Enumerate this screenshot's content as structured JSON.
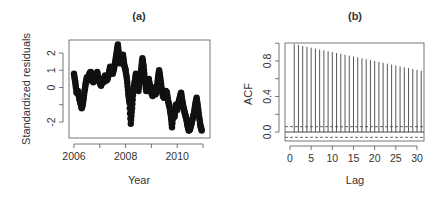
{
  "chart_data": [
    {
      "type": "line",
      "title": "(a)",
      "xlabel": "Year",
      "ylabel": "Standardized residuals",
      "xlim": [
        2006,
        2011
      ],
      "ylim": [
        -2.9,
        2.7
      ],
      "x_ticks": [
        2006,
        2007,
        2008,
        2009,
        2010,
        2011
      ],
      "x_tick_labels": [
        "2006",
        "2008",
        "2010"
      ],
      "x_tick_labels_at": [
        2006,
        2008,
        2010
      ],
      "y_ticks": [
        -2,
        -1,
        0,
        1,
        2
      ],
      "y_tick_labels": [
        "-2",
        "0",
        "1",
        "2"
      ],
      "y_tick_labels_at": [
        -2,
        0,
        1,
        2
      ],
      "grid": false,
      "marker": "filled-circle",
      "series": [
        {
          "name": "residuals",
          "x": [
            2006.0,
            2006.05,
            2006.1,
            2006.15,
            2006.2,
            2006.25,
            2006.3,
            2006.35,
            2006.4,
            2006.45,
            2006.5,
            2006.55,
            2006.6,
            2006.65,
            2006.7,
            2006.75,
            2006.8,
            2006.85,
            2006.9,
            2006.95,
            2007.0,
            2007.05,
            2007.1,
            2007.15,
            2007.2,
            2007.25,
            2007.3,
            2007.35,
            2007.4,
            2007.45,
            2007.5,
            2007.55,
            2007.6,
            2007.65,
            2007.7,
            2007.75,
            2007.8,
            2007.85,
            2007.9,
            2007.95,
            2008.0,
            2008.05,
            2008.1,
            2008.15,
            2008.2,
            2008.25,
            2008.3,
            2008.35,
            2008.4,
            2008.45,
            2008.5,
            2008.55,
            2008.6,
            2008.65,
            2008.7,
            2008.75,
            2008.8,
            2008.85,
            2008.9,
            2008.95,
            2009.0,
            2009.05,
            2009.1,
            2009.15,
            2009.2,
            2009.25,
            2009.3,
            2009.35,
            2009.4,
            2009.45,
            2009.5,
            2009.55,
            2009.6,
            2009.65,
            2009.7,
            2009.75,
            2009.8,
            2009.85,
            2009.9,
            2009.95,
            2010.0,
            2010.05,
            2010.1,
            2010.15,
            2010.2,
            2010.25,
            2010.3,
            2010.35,
            2010.4,
            2010.45,
            2010.5,
            2010.55,
            2010.6,
            2010.65,
            2010.7,
            2010.75,
            2010.8,
            2010.85,
            2010.9,
            2010.95
          ],
          "values": [
            0.8,
            0.3,
            -0.3,
            -0.2,
            -0.6,
            -0.9,
            -1.2,
            -0.9,
            -0.3,
            0.2,
            0.6,
            0.4,
            0.8,
            0.9,
            0.5,
            0.3,
            0.7,
            0.4,
            0.9,
            0.5,
            0.3,
            0.1,
            0.5,
            0.3,
            0.7,
            0.4,
            0.5,
            0.8,
            1.2,
            0.9,
            0.8,
            1.1,
            1.5,
            2.0,
            2.5,
            1.8,
            1.4,
            1.8,
            1.9,
            1.3,
            1.0,
            0.5,
            -0.3,
            -0.9,
            -2.1,
            -1.2,
            -0.2,
            0.3,
            0.8,
            0.3,
            -0.2,
            0.6,
            1.0,
            1.7,
            1.2,
            0.4,
            -0.2,
            0.4,
            0.5,
            0.0,
            -0.3,
            -0.5,
            0.0,
            -0.4,
            -0.2,
            0.5,
            1.0,
            0.5,
            -0.1,
            -0.5,
            -0.6,
            -0.2,
            -0.3,
            -0.8,
            -1.1,
            -1.6,
            -2.3,
            -1.4,
            -1.7,
            -1.0,
            -1.3,
            -0.9,
            -0.6,
            -0.3,
            -0.8,
            -1.2,
            -1.5,
            -1.8,
            -2.2,
            -2.5,
            -2.4,
            -2.1,
            -1.8,
            -1.5,
            -1.0,
            -0.6,
            -1.1,
            -1.7,
            -2.2,
            -2.5
          ]
        }
      ]
    },
    {
      "type": "bar",
      "subtype": "acf-stem",
      "title": "(b)",
      "xlabel": "Lag",
      "ylabel": "ACF",
      "xlim": [
        -1,
        32
      ],
      "ylim": [
        -0.1,
        1.0
      ],
      "x_ticks": [
        0,
        5,
        10,
        15,
        20,
        25,
        30
      ],
      "x_tick_labels": [
        "0",
        "5",
        "10",
        "15",
        "20",
        "25",
        "30"
      ],
      "y_ticks": [
        0.0,
        0.2,
        0.4,
        0.6,
        0.8,
        1.0
      ],
      "y_tick_labels": [
        "0.0",
        "0.4",
        "0.8"
      ],
      "y_tick_labels_at": [
        0.0,
        0.4,
        0.8
      ],
      "grid": false,
      "confidence_band": [
        -0.06,
        0.06
      ],
      "zero_line": 0.0,
      "categories": [
        1,
        2,
        3,
        4,
        5,
        6,
        7,
        8,
        9,
        10,
        11,
        12,
        13,
        14,
        15,
        16,
        17,
        18,
        19,
        20,
        21,
        22,
        23,
        24,
        25,
        26,
        27,
        28,
        29,
        30,
        31
      ],
      "values": [
        0.99,
        0.98,
        0.97,
        0.96,
        0.95,
        0.94,
        0.93,
        0.92,
        0.91,
        0.9,
        0.89,
        0.88,
        0.87,
        0.86,
        0.85,
        0.84,
        0.83,
        0.82,
        0.81,
        0.8,
        0.79,
        0.78,
        0.77,
        0.76,
        0.75,
        0.74,
        0.73,
        0.72,
        0.71,
        0.7,
        0.69
      ]
    }
  ]
}
